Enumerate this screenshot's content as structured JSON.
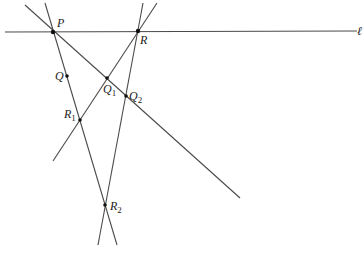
{
  "diagram": {
    "line_label": "ℓ",
    "points": [
      {
        "id": "P",
        "label": "P",
        "sub": ""
      },
      {
        "id": "R",
        "label": "R",
        "sub": ""
      },
      {
        "id": "Q",
        "label": "Q",
        "sub": ""
      },
      {
        "id": "Q1",
        "label": "Q",
        "sub": "1"
      },
      {
        "id": "Q2",
        "label": "Q",
        "sub": "2"
      },
      {
        "id": "R1",
        "label": "R",
        "sub": "1"
      },
      {
        "id": "R2",
        "label": "R",
        "sub": "2"
      }
    ]
  }
}
